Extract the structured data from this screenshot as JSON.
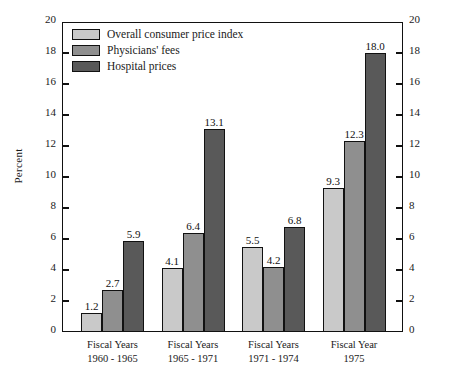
{
  "chart_data": {
    "type": "bar",
    "title": "",
    "xlabel": "",
    "ylabel": "Percent",
    "ylim": [
      0,
      20
    ],
    "ytick_step": 2,
    "yticks": [
      0,
      2,
      4,
      6,
      8,
      10,
      12,
      14,
      16,
      18,
      20
    ],
    "grid": false,
    "legend_position": "top-left inside plot",
    "categories": [
      "Fiscal Years 1960 - 1965",
      "Fiscal Years 1965 - 1971",
      "Fiscal Years 1971 - 1974",
      "Fiscal Year 1975"
    ],
    "category_lines": [
      {
        "line1": "Fiscal Years",
        "line2": "1960 - 1965"
      },
      {
        "line1": "Fiscal Years",
        "line2": "1965 - 1971"
      },
      {
        "line1": "Fiscal Years",
        "line2": "1971 - 1974"
      },
      {
        "line1": "Fiscal Year",
        "line2": "1975"
      }
    ],
    "series": [
      {
        "name": "Overall consumer price index",
        "color": "#c9c9c9",
        "values": [
          1.2,
          4.1,
          5.5,
          9.3
        ],
        "labels": [
          "1.2",
          "4.1",
          "5.5",
          "9.3"
        ]
      },
      {
        "name": "Physicians' fees",
        "color": "#8f8f8f",
        "values": [
          2.7,
          6.4,
          4.2,
          12.3
        ],
        "labels": [
          "2.7",
          "6.4",
          "4.2",
          "12.3"
        ]
      },
      {
        "name": "Hospital prices",
        "color": "#595959",
        "values": [
          5.9,
          13.1,
          6.8,
          18.0
        ],
        "labels": [
          "5.9",
          "13.1",
          "6.8",
          "18.0"
        ]
      }
    ],
    "axis_left_ticklabels": [
      "0",
      "2",
      "4",
      "6",
      "8",
      "10",
      "12",
      "14",
      "16",
      "18",
      "20"
    ],
    "axis_right_ticklabels": [
      "0",
      "2",
      "4",
      "6",
      "8",
      "10",
      "12",
      "14",
      "16",
      "18",
      "20"
    ]
  },
  "legend": {
    "items": [
      {
        "label": "Overall consumer price index",
        "color": "#c9c9c9"
      },
      {
        "label": "Physicians' fees",
        "color": "#8f8f8f"
      },
      {
        "label": "Hospital prices",
        "color": "#595959"
      }
    ]
  },
  "colors": {
    "axis": "#111111",
    "background": "#ffffff",
    "series_light": "#c9c9c9",
    "series_medium": "#8f8f8f",
    "series_dark": "#595959"
  }
}
